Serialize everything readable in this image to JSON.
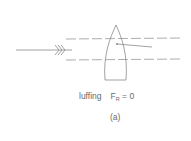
{
  "diagram": {
    "state_label": "luffing",
    "force_symbol": "F",
    "force_subscript": "R",
    "force_value": "= 0",
    "panel_label": "(a)",
    "elements": [
      "wind-arrow",
      "boat-hull",
      "sail",
      "streamline-upper",
      "streamline-lower"
    ],
    "colors": {
      "line": "#8a8a8a",
      "text": "#6a6a6a",
      "background": "#ffffff"
    }
  }
}
